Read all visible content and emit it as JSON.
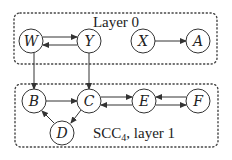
{
  "diagram": {
    "colors": {
      "stroke": "#333333",
      "group_border": "#444444",
      "text": "#222222",
      "background": "#ffffff"
    },
    "groups": [
      {
        "id": "layer0",
        "label": "Layer 0",
        "x": 14,
        "y": 13,
        "w": 203,
        "h": 51
      },
      {
        "id": "layer1",
        "label_main": "SCC",
        "label_sub": "4",
        "label_rest": ", layer 1",
        "x": 15,
        "y": 84,
        "w": 203,
        "h": 63
      }
    ],
    "nodes": [
      {
        "id": "W",
        "label": "W",
        "cx": 31,
        "cy": 41
      },
      {
        "id": "Y",
        "label": "Y",
        "cx": 89,
        "cy": 41
      },
      {
        "id": "X",
        "label": "X",
        "cx": 143,
        "cy": 41
      },
      {
        "id": "A",
        "label": "A",
        "cx": 198,
        "cy": 41
      },
      {
        "id": "B",
        "label": "B",
        "cx": 34,
        "cy": 101
      },
      {
        "id": "C",
        "label": "C",
        "cx": 89,
        "cy": 101
      },
      {
        "id": "E",
        "label": "E",
        "cx": 144,
        "cy": 101
      },
      {
        "id": "F",
        "label": "F",
        "cx": 198,
        "cy": 101
      },
      {
        "id": "D",
        "label": "D",
        "cx": 62,
        "cy": 133
      }
    ],
    "node_radius": 12,
    "edges": [
      {
        "from": "W",
        "to": "Y"
      },
      {
        "from": "Y",
        "to": "W"
      },
      {
        "from": "X",
        "to": "A"
      },
      {
        "from": "W",
        "to": "B"
      },
      {
        "from": "Y",
        "to": "C"
      },
      {
        "from": "B",
        "to": "C"
      },
      {
        "from": "C",
        "to": "E"
      },
      {
        "from": "E",
        "to": "C"
      },
      {
        "from": "F",
        "to": "E"
      },
      {
        "from": "E",
        "to": "F"
      },
      {
        "from": "C",
        "to": "D"
      },
      {
        "from": "D",
        "to": "B"
      }
    ]
  }
}
